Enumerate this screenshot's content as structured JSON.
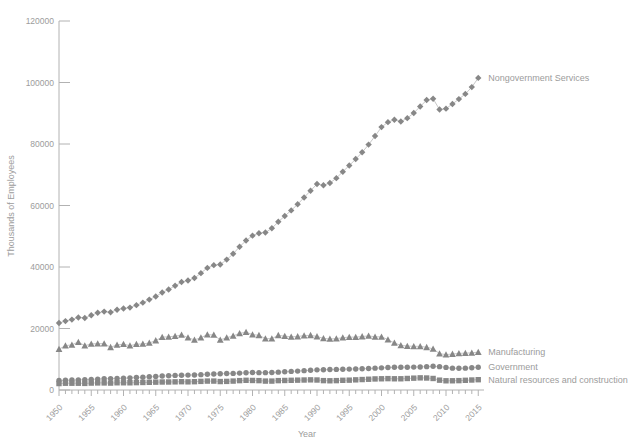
{
  "chart_data": {
    "type": "line",
    "title": "",
    "xlabel": "Year",
    "ylabel": "Thousands of Employees",
    "ylim": [
      0,
      120000
    ],
    "y_ticks": [
      0,
      20000,
      40000,
      60000,
      80000,
      100000,
      120000
    ],
    "x_range": [
      1950,
      2016
    ],
    "x_labeled_ticks": [
      1950,
      1955,
      1960,
      1965,
      1970,
      1975,
      1980,
      1985,
      1990,
      1995,
      2000,
      2005,
      2010,
      2015
    ],
    "grid": false,
    "legend_position": "end-of-line-labels",
    "years": [
      1950,
      1951,
      1952,
      1953,
      1954,
      1955,
      1956,
      1957,
      1958,
      1959,
      1960,
      1961,
      1962,
      1963,
      1964,
      1965,
      1966,
      1967,
      1968,
      1969,
      1970,
      1971,
      1972,
      1973,
      1974,
      1975,
      1976,
      1977,
      1978,
      1979,
      1980,
      1981,
      1982,
      1983,
      1984,
      1985,
      1986,
      1987,
      1988,
      1989,
      1990,
      1991,
      1992,
      1993,
      1994,
      1995,
      1996,
      1997,
      1998,
      1999,
      2000,
      2001,
      2002,
      2003,
      2004,
      2005,
      2006,
      2007,
      2008,
      2009,
      2010,
      2011,
      2012,
      2013,
      2014,
      2015
    ],
    "series": [
      {
        "name": "Nongovernment Services",
        "marker": "diamond",
        "values": [
          21800,
          22400,
          22900,
          23600,
          23400,
          24300,
          25100,
          25500,
          25300,
          26100,
          26500,
          26800,
          27600,
          28400,
          29400,
          30400,
          31700,
          32700,
          33900,
          35100,
          35600,
          36400,
          38000,
          39700,
          40600,
          40800,
          42400,
          44300,
          46600,
          48600,
          50200,
          51000,
          51200,
          52600,
          54700,
          56600,
          58400,
          60400,
          62600,
          64800,
          67000,
          66600,
          67300,
          68900,
          71000,
          73000,
          75100,
          77300,
          79800,
          82600,
          85500,
          87100,
          87900,
          87300,
          88400,
          90100,
          92200,
          94300,
          94700,
          91200,
          91500,
          93000,
          94600,
          96300,
          98500,
          101500
        ]
      },
      {
        "name": "Manufacturing",
        "marker": "triangle",
        "values": [
          13300,
          14400,
          14700,
          15600,
          14400,
          15000,
          15100,
          15100,
          13900,
          14700,
          14900,
          14400,
          14900,
          15000,
          15300,
          16100,
          17200,
          17300,
          17500,
          17900,
          17000,
          16300,
          17000,
          18000,
          17900,
          16300,
          17000,
          17600,
          18400,
          18800,
          18000,
          17800,
          16700,
          16700,
          17800,
          17500,
          17300,
          17400,
          17700,
          17800,
          17400,
          16800,
          16600,
          16700,
          17000,
          17200,
          17200,
          17400,
          17600,
          17300,
          17300,
          16400,
          15300,
          14500,
          14300,
          14200,
          14200,
          13900,
          13400,
          11800,
          11500,
          11700,
          11900,
          12000,
          12100,
          12300
        ]
      },
      {
        "name": "Government",
        "marker": "circle",
        "values": [
          3100,
          3200,
          3250,
          3300,
          3350,
          3450,
          3550,
          3650,
          3700,
          3750,
          3850,
          3950,
          4050,
          4150,
          4300,
          4400,
          4550,
          4650,
          4750,
          4800,
          4850,
          4900,
          5000,
          5100,
          5200,
          5300,
          5350,
          5400,
          5500,
          5600,
          5700,
          5650,
          5650,
          5700,
          5800,
          5950,
          6050,
          6150,
          6300,
          6400,
          6550,
          6600,
          6650,
          6700,
          6750,
          6800,
          6850,
          6900,
          7000,
          7100,
          7200,
          7300,
          7400,
          7400,
          7400,
          7450,
          7500,
          7600,
          7700,
          7600,
          7350,
          7100,
          7050,
          7100,
          7250,
          7400
        ]
      },
      {
        "name": "Natural resources and construction",
        "marker": "square",
        "values": [
          2100,
          2200,
          2200,
          2200,
          2150,
          2250,
          2300,
          2300,
          2250,
          2350,
          2350,
          2350,
          2400,
          2450,
          2500,
          2550,
          2600,
          2600,
          2650,
          2700,
          2650,
          2700,
          2800,
          2900,
          2900,
          2750,
          2800,
          2900,
          3050,
          3150,
          3100,
          3050,
          2900,
          2900,
          3050,
          3100,
          3150,
          3200,
          3250,
          3300,
          3250,
          3050,
          3000,
          3050,
          3150,
          3200,
          3300,
          3400,
          3500,
          3600,
          3650,
          3700,
          3650,
          3650,
          3750,
          3850,
          3950,
          3900,
          3750,
          3200,
          3000,
          3000,
          3050,
          3150,
          3250,
          3350
        ]
      }
    ],
    "colors": {
      "marker": "#878787",
      "series_line": "#c8c8c8",
      "axis": "#b2b2b2",
      "text": "#9c9c9c"
    }
  }
}
